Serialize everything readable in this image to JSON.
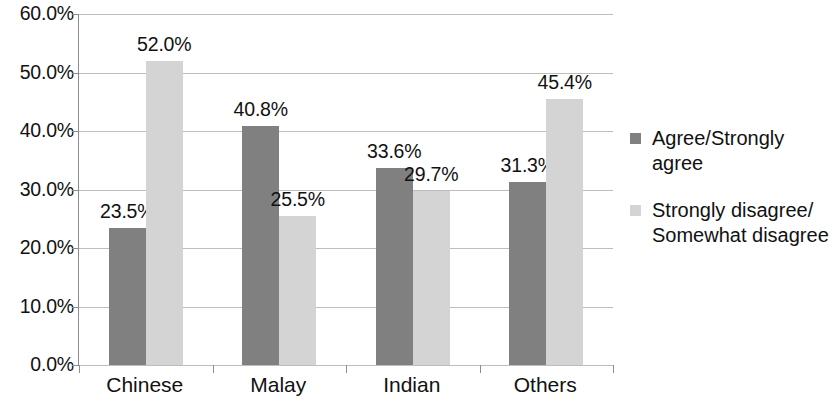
{
  "chart_data": {
    "type": "bar",
    "title": "",
    "subtitle": "",
    "xlabel": "",
    "ylabel": "",
    "categories": [
      "Chinese",
      "Malay",
      "Indian",
      "Others"
    ],
    "series": [
      {
        "name": "Agree/Strongly agree",
        "color": "#808080",
        "values": [
          23.5,
          40.8,
          33.6,
          31.3
        ],
        "value_labels": [
          "23.5%",
          "40.8%",
          "33.6%",
          "31.3%"
        ]
      },
      {
        "name": "Strongly disagree/ Somewhat disagree",
        "color": "#d4d4d4",
        "values": [
          52.0,
          25.5,
          29.7,
          45.4
        ],
        "value_labels": [
          "52.0%",
          "25.5%",
          "29.7%",
          "45.4%"
        ]
      }
    ],
    "ylim": [
      0,
      60
    ],
    "ytick_values": [
      0,
      10,
      20,
      30,
      40,
      50,
      60
    ],
    "ytick_labels": [
      "0.0%",
      "10.0%",
      "20.0%",
      "30.0%",
      "40.0%",
      "50.0%",
      "60.0%"
    ],
    "grid": "horizontal",
    "legend_position": "right",
    "legend_entries": [
      {
        "label": "Agree/Strongly agree",
        "color": "#808080",
        "swatch": "legend-swatch-dark"
      },
      {
        "label": "Strongly disagree/ Somewhat disagree",
        "color": "#d4d4d4",
        "swatch": "legend-swatch-light"
      }
    ]
  }
}
